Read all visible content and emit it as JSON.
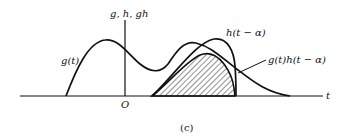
{
  "figure": {
    "caption": "(c)",
    "axes": {
      "vertical_label": "g, h, gh",
      "horizontal_label": "t",
      "origin_label": "O"
    },
    "curves": [
      {
        "id": "g",
        "label": "g(t)"
      },
      {
        "id": "h_shifted",
        "label": "h(t − α)"
      },
      {
        "id": "product",
        "label": "g(t)h(t − α)",
        "fill": "hatched"
      }
    ],
    "colors": {
      "stroke": "#111111",
      "background": "#ffffff"
    }
  }
}
